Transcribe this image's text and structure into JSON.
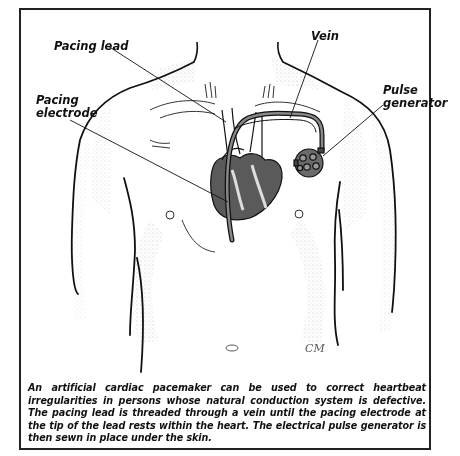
{
  "figure": {
    "labels": {
      "pacing_lead": "Pacing lead",
      "vein": "Vein",
      "pulse_generator_line1": "Pulse",
      "pulse_generator_line2": "generator",
      "pacing_electrode_line1": "Pacing",
      "pacing_electrode_line2": "electrode"
    },
    "signature": "CM",
    "caption": "An artificial cardiac pacemaker can be used to correct heartbeat irregularities in persons whose natural conduction system is defective. The pacing lead is threaded through a vein until the pacing electrode at the tip of the lead rests within the heart. The electrical pulse generator is then sewn in place under the skin."
  },
  "colors": {
    "ink": "#111111",
    "stipple": "#9a9a9a",
    "heart_fill": "#6b6b6b",
    "background": "#ffffff"
  }
}
